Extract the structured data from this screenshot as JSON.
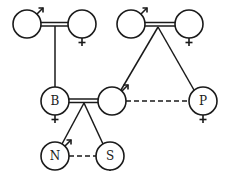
{
  "diagram": {
    "type": "family-pedigree",
    "colors": {
      "stroke": "#1a1a1a",
      "background": "#ffffff"
    },
    "nodes": [
      {
        "id": "gp1-male",
        "label": "",
        "sex": "male"
      },
      {
        "id": "gp1-female",
        "label": "",
        "sex": "female"
      },
      {
        "id": "gp2-male",
        "label": "",
        "sex": "male"
      },
      {
        "id": "gp2-female",
        "label": "",
        "sex": "female"
      },
      {
        "id": "B",
        "label": "B",
        "sex": "female"
      },
      {
        "id": "spouse-male",
        "label": "",
        "sex": "male"
      },
      {
        "id": "P",
        "label": "P",
        "sex": "female"
      },
      {
        "id": "N",
        "label": "N",
        "sex": "male"
      },
      {
        "id": "S",
        "label": "S",
        "sex": "female"
      }
    ],
    "edges": [
      {
        "from": "gp1-male",
        "to": "gp1-female",
        "kind": "marriage-double-line"
      },
      {
        "from": "gp1-couple",
        "to": "B",
        "kind": "descent"
      },
      {
        "from": "gp2-male",
        "to": "gp2-female",
        "kind": "marriage-double-line"
      },
      {
        "from": "gp2-couple",
        "to": "spouse-male",
        "kind": "descent"
      },
      {
        "from": "gp2-couple",
        "to": "P",
        "kind": "descent"
      },
      {
        "from": "B",
        "to": "spouse-male",
        "kind": "marriage-double-line"
      },
      {
        "from": "spouse-male",
        "to": "P",
        "kind": "sibling-dashed"
      },
      {
        "from": "B-couple",
        "to": "N",
        "kind": "descent"
      },
      {
        "from": "B-couple",
        "to": "S",
        "kind": "descent"
      },
      {
        "from": "N",
        "to": "S",
        "kind": "sibling-dashed"
      }
    ]
  }
}
